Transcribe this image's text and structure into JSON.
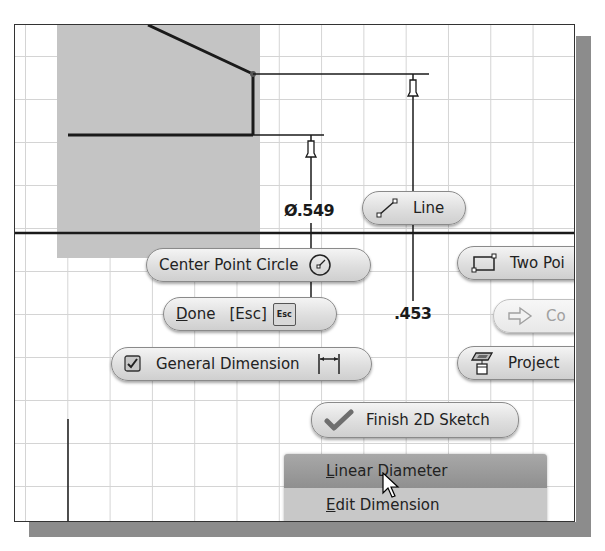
{
  "canvas": {
    "dimensions": [
      {
        "label": "Ø.549",
        "kind": "diameter"
      },
      {
        "label": ".453",
        "kind": "linear"
      }
    ]
  },
  "marking_menu": {
    "items": [
      {
        "id": "line",
        "label": "Line",
        "icon": "line-icon",
        "enabled": true
      },
      {
        "id": "center-point-circle",
        "label": "Center Point Circle",
        "icon": "circle-icon",
        "enabled": true
      },
      {
        "id": "two-point-rectangle",
        "label": "Two Poi",
        "icon": "rectangle-icon",
        "enabled": true
      },
      {
        "id": "done",
        "label_prefix": "D",
        "label_rest": "one",
        "shortcut": "[Esc]",
        "key_badge": "Esc",
        "enabled": true
      },
      {
        "id": "continue",
        "label": "Co",
        "icon": "arrow-right-icon",
        "enabled": false
      },
      {
        "id": "general-dimension",
        "label": "General Dimension",
        "icon": "dimension-icon",
        "checked": true,
        "enabled": true
      },
      {
        "id": "project",
        "label": "Project",
        "icon": "project-geometry-icon",
        "enabled": true
      },
      {
        "id": "finish-2d-sketch",
        "label": "Finish 2D Sketch",
        "icon": "checkmark-icon",
        "enabled": true
      }
    ]
  },
  "context_menu": {
    "items": [
      {
        "mnemonic": "L",
        "rest": "inear Diameter",
        "active": true
      },
      {
        "mnemonic": "E",
        "rest": "dit Dimension",
        "active": false
      }
    ]
  },
  "colors": {
    "grid": "#d4d4d4",
    "profile_fill": "#c4c4c4",
    "sketch_line": "#1a1a1a",
    "menu_highlight": "#9a9a9a"
  }
}
